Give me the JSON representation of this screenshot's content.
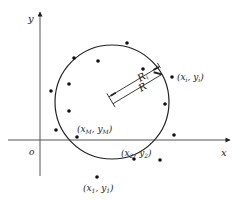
{
  "axes": {
    "x_label": "x",
    "y_label": "y",
    "origin_label": "o"
  },
  "circle": {
    "center": [
      112,
      102
    ],
    "radius": 57
  },
  "labels": {
    "point_i": "(x",
    "point_i_sub": "i",
    "point_i_mid": ", y",
    "point_i_sub2": "i",
    "point_i_end": ")",
    "point_M": "(x",
    "point_M_sub": "M",
    "point_M_mid": ", y",
    "point_M_sub2": "M",
    "point_M_end": ")",
    "point_2": "(x",
    "point_2_sub": "2",
    "point_2_mid": ", y",
    "point_2_sub2": "2",
    "point_2_end": ")",
    "point_1": "(x",
    "point_1_sub": "1",
    "point_1_mid": ", y",
    "point_1_sub2": "1",
    "point_1_end": ")",
    "R_i": "R",
    "R_i_sub": "i",
    "R": "R"
  },
  "points": [
    {
      "x": 74,
      "y": 58
    },
    {
      "x": 98,
      "y": 61
    },
    {
      "x": 127,
      "y": 43
    },
    {
      "x": 143,
      "y": 69
    },
    {
      "x": 51,
      "y": 91
    },
    {
      "x": 69,
      "y": 84
    },
    {
      "x": 69,
      "y": 111
    },
    {
      "x": 56,
      "y": 130
    },
    {
      "x": 77,
      "y": 137
    },
    {
      "x": 164,
      "y": 78
    },
    {
      "x": 165,
      "y": 104
    },
    {
      "x": 175,
      "y": 135
    },
    {
      "x": 160,
      "y": 160
    },
    {
      "x": 134,
      "y": 159
    },
    {
      "x": 97,
      "y": 177
    }
  ]
}
